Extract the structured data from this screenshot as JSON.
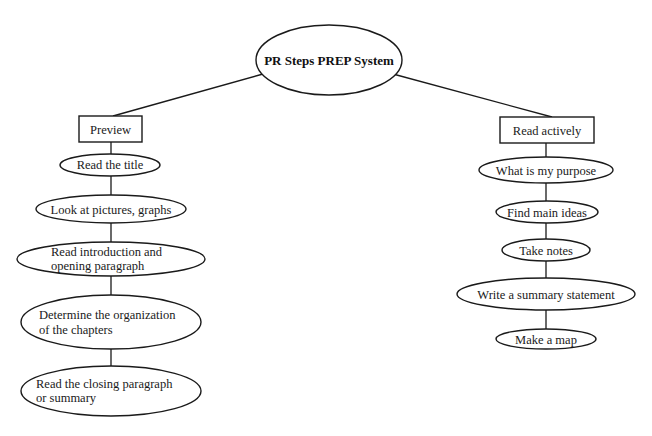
{
  "diagram": {
    "root": {
      "label": "PR Steps PREP System"
    },
    "branches": [
      {
        "label": "Preview",
        "steps": [
          {
            "lines": [
              "Read the title"
            ]
          },
          {
            "lines": [
              "Look at pictures, graphs"
            ]
          },
          {
            "lines": [
              "Read introduction and",
              "opening paragraph"
            ]
          },
          {
            "lines": [
              "Determine the organization",
              "of the chapters"
            ]
          },
          {
            "lines": [
              "Read the closing paragraph",
              "or summary"
            ]
          }
        ]
      },
      {
        "label": "Read actively",
        "steps": [
          {
            "lines": [
              "What is my purpose"
            ]
          },
          {
            "lines": [
              "Find main ideas"
            ]
          },
          {
            "lines": [
              "Take notes"
            ]
          },
          {
            "lines": [
              "Write a summary statement"
            ]
          },
          {
            "lines": [
              "Make a map"
            ]
          }
        ]
      }
    ]
  }
}
